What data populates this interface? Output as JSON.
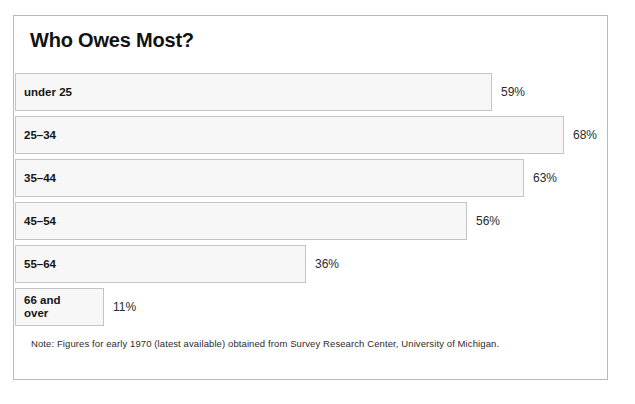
{
  "chart_data": {
    "type": "bar",
    "orientation": "horizontal",
    "title": "Who Owes Most?",
    "categories": [
      "under 25",
      "25–34",
      "35–44",
      "45–54",
      "55–64",
      "66 and\nover"
    ],
    "values": [
      59,
      68,
      63,
      56,
      36,
      11
    ],
    "value_labels": [
      "59%",
      "68%",
      "63%",
      "56%",
      "36%",
      "11%"
    ],
    "xlabel": "",
    "ylabel": "",
    "xlim": [
      0,
      68
    ],
    "grid": false,
    "legend": false,
    "note": "Note: Figures for early 1970 (latest available) obtained from Survey Research Center, University of Michigan.",
    "colors": {
      "bar_fill": "#f7f7f7",
      "bar_border": "#c4c4c4",
      "frame_border": "#b9b9b9",
      "title_text": "#121212",
      "label_text": "#141414",
      "value_text": "#2a2a2a",
      "note_text": "#2c2c2c",
      "background": "#ffffff"
    }
  }
}
